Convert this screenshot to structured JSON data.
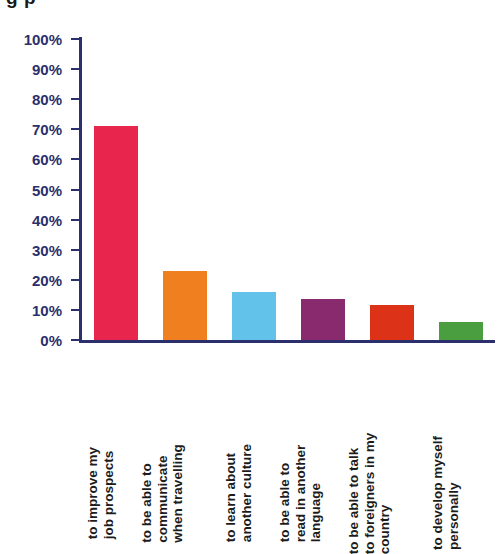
{
  "figure": {
    "title_fragment": "g    p",
    "axis_color": "#2b2f6b",
    "background": "#ffffff"
  },
  "chart_data": {
    "type": "bar",
    "title": "",
    "xlabel": "",
    "ylabel": "",
    "ylim": [
      0,
      100
    ],
    "grid": false,
    "legend": "none",
    "tick_suffix": "%",
    "categories": [
      "to improve my job prospects",
      "to be able to communicate when travelling",
      "to learn about another culture",
      "to be able to read in another language",
      "to be able to talk to foreigners in my country",
      "to develop myself personally"
    ],
    "category_lines": [
      [
        "to improve my",
        "job prospects"
      ],
      [
        "to be able to",
        "communicate",
        "when travelling"
      ],
      [
        "to learn about",
        "another culture"
      ],
      [
        "to be able to",
        "read in another",
        "language"
      ],
      [
        "to be able to talk",
        "to foreigners in my",
        "country"
      ],
      [
        "to develop myself",
        "personally"
      ]
    ],
    "values": [
      71,
      23,
      16,
      13.5,
      11.5,
      6
    ],
    "colors": [
      "#e8254d",
      "#f07f1f",
      "#62c2ea",
      "#8a2a6e",
      "#dc3218",
      "#4a9e3f"
    ],
    "y_ticks": [
      0,
      10,
      20,
      30,
      40,
      50,
      60,
      70,
      80,
      90,
      100
    ],
    "y_tick_labels": [
      "0%",
      "10%",
      "20%",
      "30%",
      "40%",
      "50%",
      "60%",
      "70%",
      "80%",
      "90%",
      "100%"
    ]
  }
}
